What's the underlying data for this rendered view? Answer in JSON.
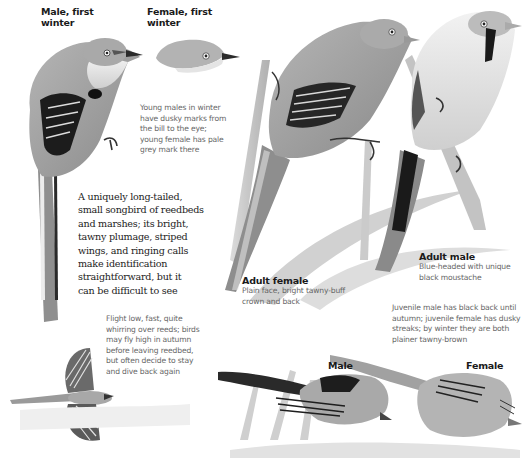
{
  "labels": {
    "male_first_winter": [
      "Male, first",
      "winter"
    ],
    "female_first_winter": [
      "Female, first",
      "winter"
    ],
    "adult_female": "Adult female",
    "adult_male": "Adult male",
    "bottom_male": "Male",
    "bottom_female": "Female"
  },
  "captions": {
    "young_winter": [
      "Young males in winter",
      "have dusky marks from",
      "the bill to the eye;",
      "young female has pale",
      "grey mark there"
    ],
    "intro": [
      "A uniquely long-tailed,",
      "small songbird of reedbeds",
      "and marshes; its bright,",
      "tawny plumage, striped",
      "wings, and ringing calls",
      "make identification",
      "straightforward, but it",
      "can be difficult to see"
    ],
    "adult_female": [
      "Plain face, bright tawny-buff",
      "crown and back"
    ],
    "adult_male": [
      "Blue-headed with unique",
      "black moustache"
    ],
    "juvenile": [
      "Juvenile male has black back until",
      "autumn; juvenile female has dusky",
      "streaks; by winter they are both",
      "plainer tawny-brown"
    ],
    "flight": [
      "Flight low, fast, quite",
      "whirring over reeds; birds",
      "may fly high in autumn",
      "before leaving reedbed,",
      "but often decide to stay",
      "and dive back again"
    ]
  },
  "colors": {
    "text_bold": "#1a1a1a",
    "text_caption": "#666666",
    "plumage_mid": "#9a9a9a",
    "plumage_dark": "#1e1e1e",
    "plumage_light": "#e6e6e6"
  }
}
